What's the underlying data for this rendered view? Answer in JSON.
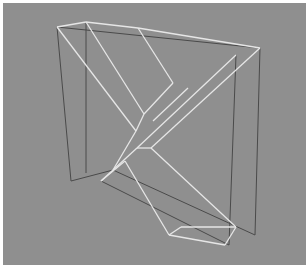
{
  "image": {
    "description": "Grayscale wireframe rendering of an X-shaped solid inside a rectangular box frame",
    "background_color": "#8f8f8f",
    "dark_line_color": "#4a4a4a",
    "light_line_color": "#e6e6e6"
  },
  "wireframe": {
    "dark_edges": [
      [
        54,
        24,
        257,
        45
      ],
      [
        54,
        24,
        68,
        178
      ],
      [
        257,
        45,
        252,
        232
      ],
      [
        83,
        19,
        83,
        170
      ],
      [
        233,
        52,
        226,
        242
      ],
      [
        68,
        178,
        110,
        167
      ],
      [
        98,
        178,
        226,
        242
      ],
      [
        110,
        167,
        252,
        232
      ]
    ],
    "light_edges": [
      [
        54,
        24,
        83,
        19
      ],
      [
        83,
        19,
        135,
        25
      ],
      [
        135,
        25,
        257,
        45
      ],
      [
        54,
        24,
        133,
        128
      ],
      [
        83,
        19,
        141,
        111
      ],
      [
        135,
        25,
        170,
        80
      ],
      [
        170,
        80,
        141,
        111
      ],
      [
        141,
        111,
        133,
        128
      ],
      [
        133,
        128,
        110,
        167
      ],
      [
        257,
        45,
        148,
        145
      ],
      [
        233,
        52,
        134,
        145
      ],
      [
        134,
        145,
        148,
        145
      ],
      [
        148,
        145,
        233,
        224
      ],
      [
        134,
        145,
        98,
        178
      ],
      [
        98,
        178,
        122,
        158
      ],
      [
        122,
        158,
        166,
        232
      ],
      [
        166,
        232,
        178,
        224
      ],
      [
        178,
        224,
        233,
        224
      ],
      [
        233,
        224,
        222,
        242
      ],
      [
        166,
        232,
        222,
        242
      ],
      [
        150,
        118,
        185,
        85
      ]
    ]
  }
}
